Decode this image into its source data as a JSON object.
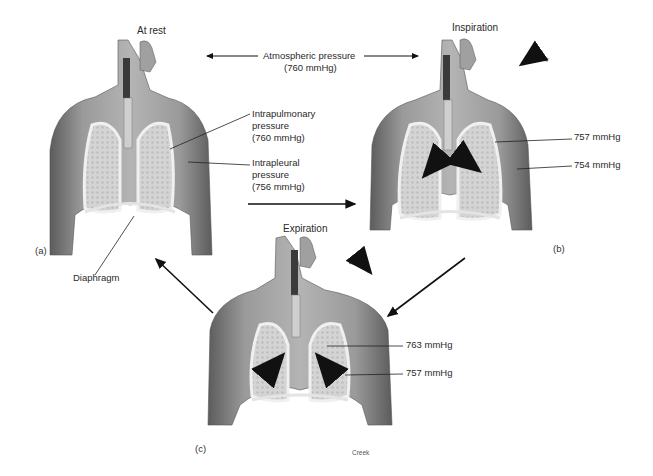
{
  "figure": {
    "panels": [
      {
        "id": "a",
        "letter": "(a)",
        "title": "At rest",
        "labels": {
          "intrapulmonary": [
            "Intrapulmonary",
            "pressure",
            "(760 mmHg)"
          ],
          "intrapleural": [
            "Intrapleural",
            "pressure",
            "(756 mmHg)"
          ],
          "diaphragm": "Diaphragm"
        }
      },
      {
        "id": "b",
        "letter": "(b)",
        "title": "Inspiration",
        "labels": {
          "intrapulmonary": "757 mmHg",
          "intrapleural": "754 mmHg"
        }
      },
      {
        "id": "c",
        "letter": "(c)",
        "title": "Expiration",
        "labels": {
          "intrapulmonary": "763 mmHg",
          "intrapleural": "757 mmHg"
        },
        "credit": "Creek"
      }
    ],
    "atmospheric": {
      "line1": "Atmospheric pressure",
      "line2": "(760 mmHg)"
    },
    "colors": {
      "skin_dark": "#6e6e6e",
      "skin_mid": "#9a9a9a",
      "skin_light": "#c8c8c8",
      "lung": "#d9d9d9",
      "pleura": "#efefef",
      "arrow": "#111111",
      "airflow_arrow": "#8a8a8a"
    }
  }
}
